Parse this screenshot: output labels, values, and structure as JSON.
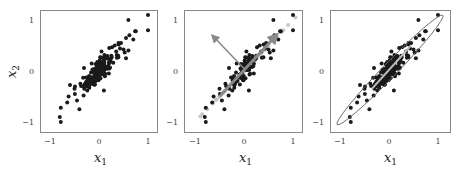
{
  "chart_data": [
    {
      "type": "scatter",
      "title": "",
      "xlabel": "x_1",
      "ylabel": "x_2",
      "xlim": [
        -1.2,
        1.2
      ],
      "ylim": [
        -1.2,
        1.2
      ],
      "xticks": [
        -1,
        0,
        1
      ],
      "yticks": [
        -1,
        0,
        1
      ],
      "grid": false,
      "description": "Correlated 2D data points",
      "series": [
        {
          "name": "data",
          "color": "#222222",
          "points": "strongly positively correlated cloud along x2 = x1, ~200 points, x1 in [-0.85, 1.0]"
        }
      ]
    },
    {
      "type": "scatter",
      "title": "",
      "xlabel": "x_1",
      "ylabel": "",
      "xlim": [
        -1.2,
        1.2
      ],
      "ylim": [
        -1.2,
        1.2
      ],
      "xticks": [
        -1,
        0,
        1
      ],
      "yticks": [
        -1,
        0,
        1
      ],
      "grid": false,
      "description": "Data with principal component arrows and projections onto first PC",
      "series": [
        {
          "name": "data",
          "color": "#222222"
        },
        {
          "name": "projections",
          "color": "#bbbbbb"
        }
      ],
      "arrows": [
        {
          "name": "pc1",
          "from": [
            -0.5,
            -0.5
          ],
          "to": [
            0.68,
            0.72
          ],
          "color": "#888888",
          "width": 3
        },
        {
          "name": "pc2",
          "from": [
            0.0,
            0.05
          ],
          "to": [
            -0.65,
            0.7
          ],
          "color": "#888888",
          "width": 1.5
        }
      ]
    },
    {
      "type": "scatter",
      "title": "",
      "xlabel": "x_1",
      "ylabel": "",
      "xlim": [
        -1.2,
        1.2
      ],
      "ylim": [
        -1.2,
        1.2
      ],
      "xticks": [
        -1,
        0,
        1
      ],
      "yticks": [
        -1,
        0,
        1
      ],
      "grid": false,
      "description": "Data with covariance ellipse and principal axis",
      "series": [
        {
          "name": "data",
          "color": "#222222"
        }
      ],
      "ellipse": {
        "center": [
          0.0,
          0.0
        ],
        "major_axis_end": [
          0.72,
          0.78
        ],
        "angle_deg": 45,
        "semi_major": 1.05,
        "semi_minor": 0.1,
        "color": "#666666"
      }
    }
  ],
  "panels": [
    {
      "xlabel_main": "x",
      "xlabel_sub": "1",
      "ylabel_main": "x",
      "ylabel_sub": "2",
      "ticks": {
        "x": [
          "−1",
          "0",
          "1"
        ],
        "y": [
          "1",
          "0",
          "−1"
        ]
      }
    },
    {
      "xlabel_main": "x",
      "xlabel_sub": "1",
      "ticks": {
        "x": [
          "−1",
          "0",
          "1"
        ],
        "y": [
          "1",
          "0",
          "−1"
        ]
      }
    },
    {
      "xlabel_main": "x",
      "xlabel_sub": "1",
      "ticks": {
        "x": [
          "−1",
          "0",
          "1"
        ],
        "y": [
          "1",
          "0",
          "−1"
        ]
      }
    }
  ]
}
